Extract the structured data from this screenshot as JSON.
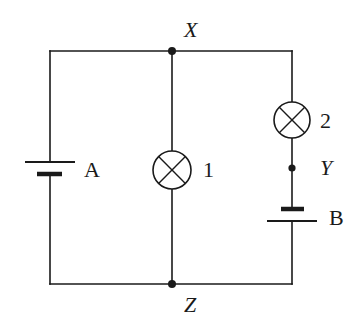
{
  "diagram": {
    "type": "electric-circuit",
    "nodes": {
      "X": {
        "label": "X",
        "kind": "junction"
      },
      "Y": {
        "label": "Y",
        "kind": "point"
      },
      "Z": {
        "label": "Z",
        "kind": "junction"
      }
    },
    "components": [
      {
        "id": "A",
        "label": "A",
        "kind": "cell",
        "branch": "left"
      },
      {
        "id": "1",
        "label": "1",
        "kind": "lamp",
        "branch": "middle"
      },
      {
        "id": "2",
        "label": "2",
        "kind": "lamp",
        "branch": "right"
      },
      {
        "id": "B",
        "label": "B",
        "kind": "cell",
        "branch": "right"
      }
    ],
    "connections": [
      "Left branch: X – cell A – Z",
      "Middle branch: X – lamp 1 – Z",
      "Right branch: X – lamp 2 – Y – cell B – Z"
    ],
    "colors": {
      "ink": "#1a1a1a",
      "background": "#ffffff"
    }
  }
}
